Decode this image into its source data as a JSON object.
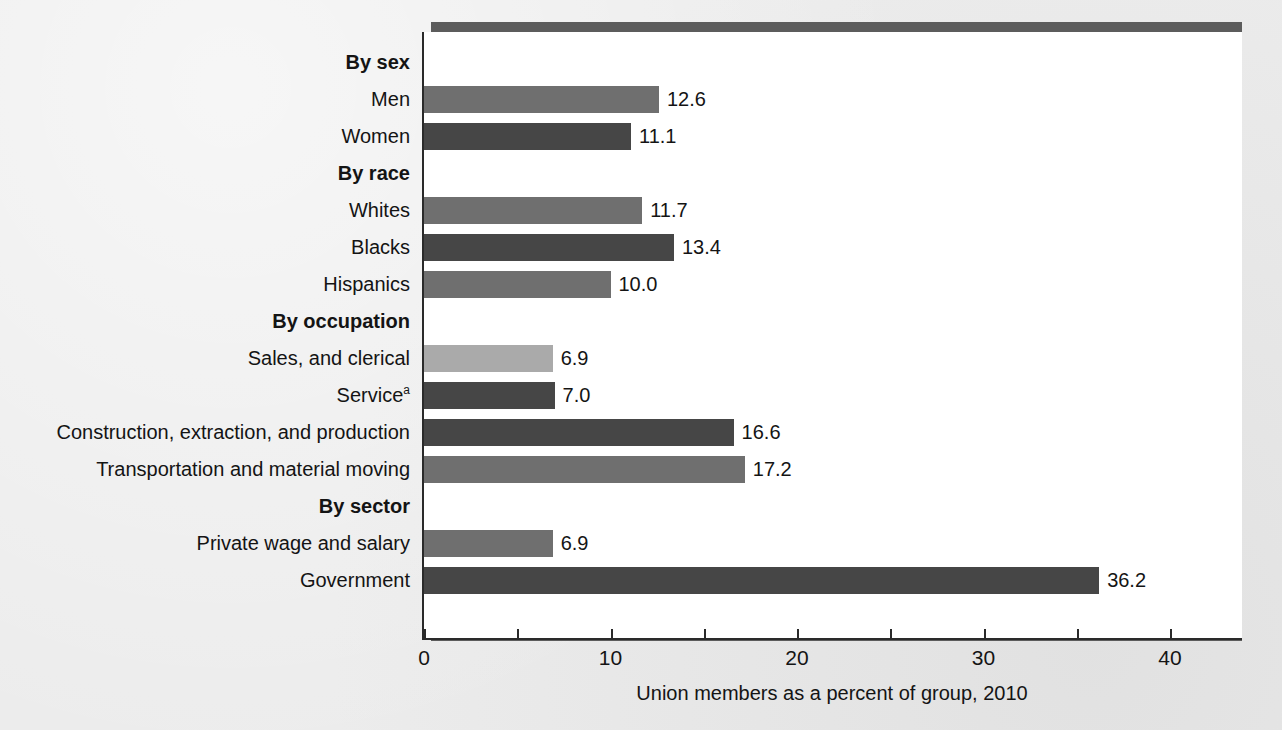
{
  "chart_data": {
    "type": "bar",
    "orientation": "horizontal",
    "title": "",
    "xlabel": "Union members as a percent of group, 2010",
    "ylabel": "",
    "xlim": [
      0,
      40
    ],
    "xticks": [
      0,
      5,
      10,
      15,
      20,
      25,
      30,
      35,
      40
    ],
    "xtick_labels": [
      "0",
      "",
      "10",
      "",
      "20",
      "",
      "30",
      "",
      "40"
    ],
    "grid": false,
    "legend": "none",
    "footnote_marker": "a",
    "rows": [
      {
        "label": "By sex",
        "is_group": true,
        "value": null,
        "value_label": "",
        "shade": ""
      },
      {
        "label": "Men",
        "is_group": false,
        "value": 12.6,
        "value_label": "12.6",
        "shade": "mid"
      },
      {
        "label": "Women",
        "is_group": false,
        "value": 11.1,
        "value_label": "11.1",
        "shade": "dark"
      },
      {
        "label": "By race",
        "is_group": true,
        "value": null,
        "value_label": "",
        "shade": ""
      },
      {
        "label": "Whites",
        "is_group": false,
        "value": 11.7,
        "value_label": "11.7",
        "shade": "mid"
      },
      {
        "label": "Blacks",
        "is_group": false,
        "value": 13.4,
        "value_label": "13.4",
        "shade": "dark"
      },
      {
        "label": "Hispanics",
        "is_group": false,
        "value": 10.0,
        "value_label": "10.0",
        "shade": "mid"
      },
      {
        "label": "By occupation",
        "is_group": true,
        "value": null,
        "value_label": "",
        "shade": ""
      },
      {
        "label": "Sales, and clerical",
        "is_group": false,
        "value": 6.9,
        "value_label": "6.9",
        "shade": "light"
      },
      {
        "label": "Service",
        "superscript": "a",
        "is_group": false,
        "value": 7.0,
        "value_label": "7.0",
        "shade": "dark"
      },
      {
        "label": "Construction, extraction, and production",
        "is_group": false,
        "value": 16.6,
        "value_label": "16.6",
        "shade": "dark"
      },
      {
        "label": "Transportation and material moving",
        "is_group": false,
        "value": 17.2,
        "value_label": "17.2",
        "shade": "mid"
      },
      {
        "label": "By sector",
        "is_group": true,
        "value": null,
        "value_label": "",
        "shade": ""
      },
      {
        "label": "Private wage and salary",
        "is_group": false,
        "value": 6.9,
        "value_label": "6.9",
        "shade": "mid"
      },
      {
        "label": "Government",
        "is_group": false,
        "value": 36.2,
        "value_label": "36.2",
        "shade": "dark"
      }
    ],
    "categories": [
      "Men",
      "Women",
      "Whites",
      "Blacks",
      "Hispanics",
      "Sales, and clerical",
      "Service",
      "Construction, extraction, and production",
      "Transportation and material moving",
      "Private wage and salary",
      "Government"
    ],
    "values": [
      12.6,
      11.1,
      11.7,
      13.4,
      10.0,
      6.9,
      7.0,
      16.6,
      17.2,
      6.9,
      36.2
    ],
    "group_headers": [
      "By sex",
      "By race",
      "By occupation",
      "By sector"
    ],
    "colors": {
      "bar_light": "#aaaaaa",
      "bar_mid": "#6f6f6f",
      "bar_dark": "#464646",
      "axis": "#2a2a2a",
      "plot_background": "#ffffff",
      "page_background": "#ececec",
      "frame_shadow": "#5c5c5c"
    }
  }
}
